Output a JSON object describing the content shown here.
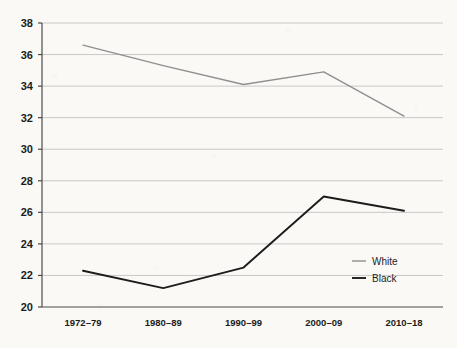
{
  "chart_data": {
    "type": "line",
    "title": "",
    "subtitle": "",
    "xlabel": "",
    "ylabel": "",
    "categories": [
      "1972–79",
      "1980–89",
      "1990–99",
      "2000–09",
      "2010–18"
    ],
    "series": [
      {
        "name": "White",
        "color": "#8f8f8f",
        "values": [
          36.6,
          35.3,
          34.1,
          34.9,
          32.1
        ]
      },
      {
        "name": "Black",
        "color": "#1c1c1c",
        "values": [
          22.3,
          21.2,
          22.5,
          27.0,
          26.1
        ]
      }
    ],
    "ylim": [
      20,
      38
    ],
    "ytick_step": 2,
    "yticks": [
      20,
      22,
      24,
      26,
      28,
      30,
      32,
      34,
      36,
      38
    ],
    "grid": true,
    "grid_axis": "y",
    "grid_color": "#c8c8c8",
    "axis_color": "#4a4a4a",
    "legend_position": "inside-bottom-right",
    "background_color": "#faf9f6"
  },
  "legend": {
    "items": [
      {
        "label": "White",
        "color": "#8f8f8f"
      },
      {
        "label": "Black",
        "color": "#1c1c1c"
      }
    ]
  }
}
